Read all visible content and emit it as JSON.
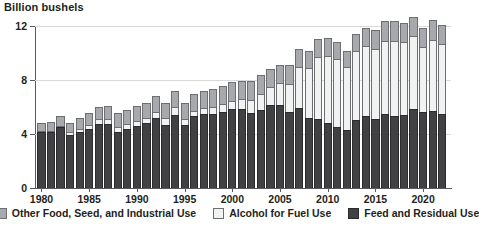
{
  "chart_data": {
    "type": "bar",
    "stacked": true,
    "title": "",
    "subtitle": "",
    "ylabel": "Billion bushels",
    "xlabel": "",
    "ylim": [
      0,
      12
    ],
    "yticks": [
      0,
      4,
      8,
      12
    ],
    "ytick_labels": [
      "0",
      "4",
      "8",
      "12"
    ],
    "grid": true,
    "grid_axis": "y",
    "legend_position": "bottom",
    "xtick_labels": [
      "1980",
      "1985",
      "1990",
      "1995",
      "2000",
      "2005",
      "2010",
      "2015",
      "2020"
    ],
    "categories": [
      "1980",
      "1981",
      "1982",
      "1983",
      "1984",
      "1985",
      "1986",
      "1987",
      "1988",
      "1989",
      "1990",
      "1991",
      "1992",
      "1993",
      "1994",
      "1995",
      "1996",
      "1997",
      "1998",
      "1999",
      "2000",
      "2001",
      "2002",
      "2003",
      "2004",
      "2005",
      "2006",
      "2007",
      "2008",
      "2009",
      "2010",
      "2011",
      "2012",
      "2013",
      "2014",
      "2015",
      "2016",
      "2017",
      "2018",
      "2019",
      "2020",
      "2021",
      "2022"
    ],
    "series": [
      {
        "name": "Feed and Residual Use",
        "color": "#414042",
        "values": [
          4.13,
          4.18,
          4.51,
          3.96,
          4.15,
          4.36,
          4.77,
          4.75,
          4.14,
          4.38,
          4.61,
          4.79,
          5.22,
          4.7,
          5.44,
          4.7,
          5.3,
          5.45,
          5.5,
          5.66,
          5.84,
          5.86,
          5.56,
          5.8,
          6.16,
          6.15,
          5.6,
          5.91,
          5.18,
          5.13,
          4.79,
          4.54,
          4.31,
          5.04,
          5.31,
          5.11,
          5.47,
          5.3,
          5.43,
          5.87,
          5.6,
          5.67,
          5.51
        ]
      },
      {
        "name": "Alcohol for Fuel Use",
        "color": "#f1f2f2",
        "values": [
          0.04,
          0.08,
          0.12,
          0.16,
          0.22,
          0.28,
          0.32,
          0.35,
          0.39,
          0.38,
          0.35,
          0.4,
          0.43,
          0.46,
          0.53,
          0.4,
          0.43,
          0.48,
          0.53,
          0.57,
          0.63,
          0.71,
          0.99,
          1.17,
          1.32,
          1.6,
          2.12,
          3.03,
          3.71,
          4.59,
          5.02,
          5.01,
          4.64,
          5.13,
          5.2,
          5.21,
          5.43,
          5.61,
          5.38,
          5.38,
          4.86,
          5.33,
          5.18
        ]
      },
      {
        "name": "Other Food, Seed, and Industrial Use",
        "color": "#a7a9ac",
        "values": [
          0.62,
          0.66,
          0.71,
          0.72,
          0.8,
          0.9,
          0.92,
          0.96,
          1.0,
          1.04,
          1.09,
          1.13,
          1.15,
          1.17,
          1.21,
          1.22,
          1.26,
          1.29,
          1.32,
          1.36,
          1.38,
          1.39,
          1.38,
          1.37,
          1.37,
          1.37,
          1.36,
          1.34,
          1.27,
          1.29,
          1.31,
          1.28,
          1.23,
          1.26,
          1.32,
          1.35,
          1.44,
          1.44,
          1.41,
          1.4,
          1.42,
          1.41,
          1.37
        ]
      }
    ]
  },
  "legend": {
    "items": [
      {
        "label": "Other Food, Seed, and Industrial Use",
        "swatch": "other"
      },
      {
        "label": "Alcohol for Fuel Use",
        "swatch": "fuel"
      },
      {
        "label": "Feed and Residual Use",
        "swatch": "feed"
      }
    ]
  }
}
